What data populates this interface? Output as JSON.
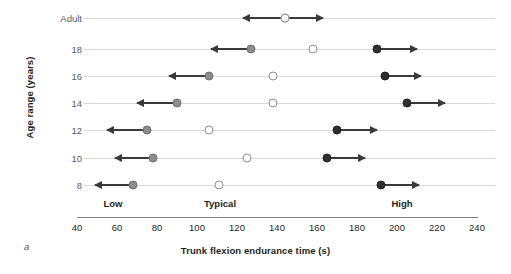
{
  "chart_data": {
    "type": "scatter",
    "title": "",
    "panel_label": "a",
    "xlabel": "Trunk flexion endurance time (s)",
    "ylabel": "Age range (years)",
    "xlim": [
      40,
      240
    ],
    "xticks": [
      40,
      60,
      80,
      100,
      120,
      140,
      160,
      180,
      200,
      220,
      240
    ],
    "categories": [
      "Adult",
      "18",
      "16",
      "14",
      "12",
      "10",
      "8"
    ],
    "grid": "horizontal-row-lines",
    "legend": "none",
    "band_labels": [
      {
        "label": "Low",
        "at": 76
      },
      {
        "label": "Typical",
        "at": 130
      },
      {
        "label": "High",
        "at": 203
      }
    ],
    "series": [
      {
        "name": "Low cut-off (grey marker, arrow pointing left / lower)",
        "marker": "grey-filled-circle",
        "color": "#8d8d8d",
        "values": [
          null,
          127,
          106,
          90,
          75,
          78,
          68
        ],
        "arrow_direction": "left",
        "arrow_end_values": [
          null,
          107,
          86,
          70,
          55,
          59,
          49
        ]
      },
      {
        "name": "Typical (open circle)",
        "marker": "open-circle",
        "color": "#ffffff",
        "values": [
          144,
          158,
          138,
          138,
          106,
          125,
          111
        ],
        "arrow_direction": "none",
        "arrow_end_values": [
          null,
          null,
          null,
          null,
          null,
          null,
          null
        ]
      },
      {
        "name": "High cut-off (dark marker, arrow pointing right / higher)",
        "marker": "dark-filled-circle",
        "color": "#2f2f2f",
        "values": [
          null,
          190,
          194,
          205,
          170,
          165,
          192
        ],
        "arrow_direction": "right",
        "arrow_end_values": [
          null,
          210,
          212,
          224,
          190,
          184,
          211
        ]
      },
      {
        "name": "Adult bidirectional range",
        "marker": "open-circle",
        "color": "#ffffff",
        "values": [
          144,
          null,
          null,
          null,
          null,
          null,
          null
        ],
        "arrow_direction": "both",
        "arrow_end_values": [
          [
            123,
            163
          ],
          null,
          null,
          null,
          null,
          null,
          null
        ]
      }
    ]
  },
  "colors": {
    "low_marker": "#8d8d8d",
    "typical_marker": "#ffffff",
    "high_marker": "#2f2f2f",
    "arrow": "#3a3a3a",
    "row_line": "#d9d9d9",
    "axis": "#808080",
    "text": "#231f20",
    "tick_text": "#58595b"
  }
}
